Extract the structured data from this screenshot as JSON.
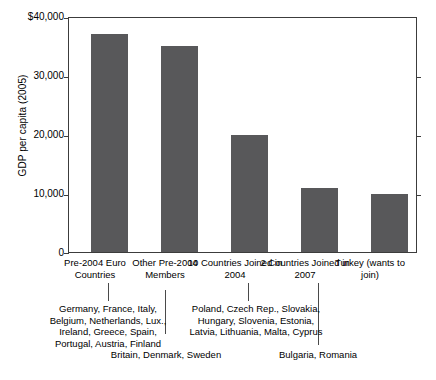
{
  "chart_data": {
    "type": "bar",
    "title": "",
    "xlabel": "",
    "ylabel": "GDP per capita (2005)",
    "ylim": [
      0,
      40000
    ],
    "grid": false,
    "legend": "none",
    "yticks": [
      0,
      10000,
      20000,
      30000,
      40000
    ],
    "ytick_labels": [
      "0",
      "10,000",
      "20,000",
      "30,000",
      "$40,000"
    ],
    "categories": [
      "Pre-2004 Euro\nCountries",
      "Other\nPre-2004\nMembers",
      "10 Countries\nJoined in 2004",
      "2 Countries\nJoined in 2007",
      "Turkey\n(wants\nto join)"
    ],
    "values": [
      37000,
      35000,
      19800,
      10800,
      9900
    ],
    "bar_color": "#58585a",
    "annotations": [
      "Germany, France, Italy,\nBelgium, Netherlands, Lux.,\nIreland, Greece, Spain,\nPortugal, Austria, Finland",
      "Britain, Denmark, Sweden",
      "Poland, Czech Rep., Slovakia,\nHungary, Slovenia, Estonia,\nLatvia, Lithuania, Malta, Cyprus",
      "Bulgaria, Romania"
    ]
  },
  "axis": {
    "y_title": "GDP per capita (2005)",
    "ticks": [
      {
        "label": "$40,000",
        "value": 40000
      },
      {
        "label": "30,000",
        "value": 30000
      },
      {
        "label": "20,000",
        "value": 20000
      },
      {
        "label": "10,000",
        "value": 10000
      },
      {
        "label": "0",
        "value": 0
      }
    ]
  },
  "bars": [
    {
      "label": "Pre-2004 Euro\nCountries",
      "value": 37000
    },
    {
      "label": "Other\nPre-2004\nMembers",
      "value": 35000
    },
    {
      "label": "10 Countries\nJoined in 2004",
      "value": 19800
    },
    {
      "label": "2 Countries\nJoined in 2007",
      "value": 10800
    },
    {
      "label": "Turkey\n(wants\nto join)",
      "value": 9900
    }
  ],
  "notes": {
    "euro_countries": "Germany, France, Italy,\nBelgium, Netherlands, Lux.,\nIreland, Greece, Spain,\nPortugal, Austria, Finland",
    "other_pre2004": "Britain, Denmark, Sweden",
    "joined_2004": "Poland, Czech Rep., Slovakia,\nHungary, Slovenia, Estonia,\nLatvia, Lithuania, Malta, Cyprus",
    "joined_2007": "Bulgaria, Romania"
  }
}
